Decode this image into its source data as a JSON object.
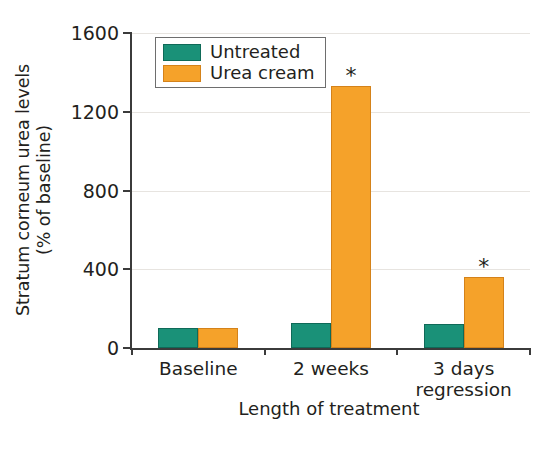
{
  "chart_data": {
    "type": "bar",
    "title": "",
    "xlabel": "Length of treatment",
    "ylabel": "Stratum corneum urea levels (% of baseline)",
    "ylabel_lines": [
      "Stratum corneum urea levels",
      "(% of baseline)"
    ],
    "categories": [
      "Baseline",
      "2 weeks",
      "3 days regression"
    ],
    "category_lines": [
      [
        "Baseline"
      ],
      [
        "2 weeks"
      ],
      [
        "3 days",
        "regression"
      ]
    ],
    "series": [
      {
        "name": "Untreated",
        "color": "#1A9178",
        "values": [
          100,
          125,
          120
        ],
        "significance": [
          "",
          "",
          ""
        ]
      },
      {
        "name": "Urea cream",
        "color": "#F5A22A",
        "values": [
          100,
          1330,
          360
        ],
        "significance": [
          "",
          "*",
          "*"
        ]
      }
    ],
    "ylim": [
      0,
      1600
    ],
    "yticks": [
      0,
      400,
      800,
      1200,
      1600
    ],
    "ytick_labels": [
      "0",
      "400",
      "800",
      "1200",
      "1600"
    ],
    "grid": true,
    "grid_axis": "y",
    "legend_position": "top-left-inside",
    "significance_marker": "*"
  },
  "legend": {
    "items": [
      {
        "label": "Untreated",
        "color": "#1A9178"
      },
      {
        "label": "Urea cream",
        "color": "#F5A22A"
      }
    ]
  },
  "axes": {
    "y_title_line1": "Stratum corneum urea levels",
    "y_title_line2": "(% of baseline)",
    "x_title": "Length of treatment",
    "y_ticks": [
      "1600",
      "1200",
      "800",
      "400",
      "0"
    ],
    "x_ticks": [
      {
        "line1": "Baseline",
        "line2": ""
      },
      {
        "line1": "2 weeks",
        "line2": ""
      },
      {
        "line1": "3 days",
        "line2": "regression"
      }
    ]
  },
  "colors": {
    "untreated": "#1A9178",
    "urea_cream": "#F5A22A",
    "axis": "#3B3B3B",
    "grid": "#E7E4E0",
    "text": "#231F20",
    "background": "#FFFFFF"
  }
}
